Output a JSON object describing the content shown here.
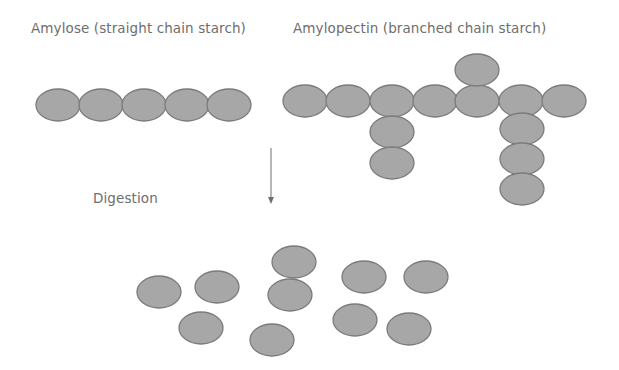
{
  "labels": {
    "amylose": "Amylose (straight chain starch)",
    "amylopectin": "Amylopectin (branched chain starch)",
    "digestion": "Digestion"
  },
  "colors": {
    "unit_fill": "#a7a7a7",
    "unit_stroke": "#7b7b7b",
    "text": "#6e6e6e",
    "arrow": "#6e6e6e"
  },
  "diagram": {
    "unit_shape": "ellipse",
    "unit_rx": 22,
    "unit_ry": 16,
    "amylose_units": [
      {
        "cx": 58,
        "cy": 105
      },
      {
        "cx": 101,
        "cy": 105
      },
      {
        "cx": 144,
        "cy": 105
      },
      {
        "cx": 187,
        "cy": 105
      },
      {
        "cx": 229,
        "cy": 105
      }
    ],
    "amylopectin_units": [
      {
        "cx": 305,
        "cy": 101
      },
      {
        "cx": 348,
        "cy": 101
      },
      {
        "cx": 392,
        "cy": 101
      },
      {
        "cx": 435,
        "cy": 101
      },
      {
        "cx": 477,
        "cy": 101
      },
      {
        "cx": 521,
        "cy": 101
      },
      {
        "cx": 564,
        "cy": 101
      },
      {
        "cx": 477,
        "cy": 70
      },
      {
        "cx": 392,
        "cy": 132
      },
      {
        "cx": 392,
        "cy": 163
      },
      {
        "cx": 522,
        "cy": 129
      },
      {
        "cx": 522,
        "cy": 159
      },
      {
        "cx": 522,
        "cy": 189
      }
    ],
    "arrow": {
      "x": 271,
      "y1": 148,
      "y2": 204
    },
    "glucose_units": [
      {
        "cx": 159,
        "cy": 292
      },
      {
        "cx": 217,
        "cy": 287
      },
      {
        "cx": 294,
        "cy": 262
      },
      {
        "cx": 290,
        "cy": 295
      },
      {
        "cx": 364,
        "cy": 277
      },
      {
        "cx": 426,
        "cy": 277
      },
      {
        "cx": 201,
        "cy": 328
      },
      {
        "cx": 272,
        "cy": 340
      },
      {
        "cx": 355,
        "cy": 320
      },
      {
        "cx": 409,
        "cy": 329
      }
    ]
  }
}
